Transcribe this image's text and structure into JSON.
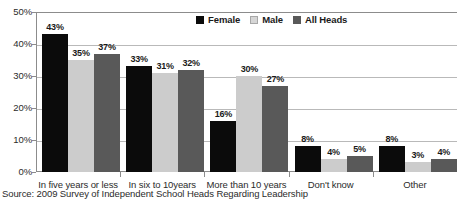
{
  "chart_data": {
    "type": "bar",
    "title": "",
    "xlabel": "",
    "ylabel": "",
    "ylim": [
      0,
      50
    ],
    "yticks": [
      "0%",
      "10%",
      "20%",
      "30%",
      "40%",
      "50%"
    ],
    "ytick_values": [
      0,
      10,
      20,
      30,
      40,
      50
    ],
    "grid": true,
    "legend_position": "top-center",
    "value_suffix": "%",
    "categories": [
      "In five years or less",
      "In six to 10years",
      "More than 10 years",
      "Don't know",
      "Other"
    ],
    "series": [
      {
        "name": "Female",
        "color": "#0b0b0b",
        "values": [
          43,
          33,
          16,
          8,
          8
        ],
        "labels": [
          "43%",
          "33%",
          "16%",
          "8%",
          "8%"
        ]
      },
      {
        "name": "Male",
        "color": "#cccccc",
        "values": [
          35,
          31,
          30,
          4,
          3
        ],
        "labels": [
          "35%",
          "31%",
          "30%",
          "4%",
          "3%"
        ]
      },
      {
        "name": "All Heads",
        "color": "#595959",
        "values": [
          37,
          32,
          27,
          5,
          4
        ],
        "labels": [
          "37%",
          "32%",
          "27%",
          "5%",
          "4%"
        ]
      }
    ]
  },
  "source": {
    "text": "Source: 2009 Survey of Independent School Heads Regarding Leadership"
  },
  "colors": {
    "female": "#0b0b0b",
    "male": "#cccccc",
    "all_heads": "#595959",
    "gridline": "#b9b9b9",
    "axis": "#8c8c8c",
    "text": "#2b2b2b"
  }
}
